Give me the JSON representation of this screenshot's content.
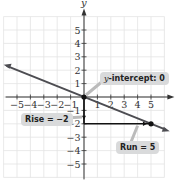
{
  "chart_data": {
    "type": "line",
    "title": "",
    "xlabel": "x",
    "ylabel": "y",
    "xlim": [
      -6,
      6
    ],
    "ylim": [
      -6,
      6
    ],
    "grid": true,
    "x_ticks": [
      -5,
      -4,
      -3,
      -2,
      -1,
      1,
      2,
      3,
      4,
      5
    ],
    "y_ticks": [
      -5,
      -4,
      -3,
      -2,
      -1,
      1,
      2,
      3,
      4,
      5
    ],
    "series": [
      {
        "name": "line",
        "equation": "y = -2/5 x",
        "slope": -0.4,
        "intercept": 0,
        "x": [
          -6,
          6
        ],
        "y": [
          2.4,
          -2.4
        ]
      }
    ],
    "points": [
      {
        "x": 0,
        "y": 0
      },
      {
        "x": 5,
        "y": -2
      }
    ],
    "annotations": [
      {
        "text": "y-intercept: 0",
        "target": [
          0,
          0
        ]
      },
      {
        "text": "Rise = −2",
        "target": [
          0,
          -1.5
        ]
      },
      {
        "text": "Run = 5",
        "target": [
          4,
          -2
        ]
      }
    ],
    "rise_segment": {
      "from": [
        0,
        0
      ],
      "to": [
        0,
        -2
      ]
    },
    "run_segment": {
      "from": [
        0,
        -2
      ],
      "to": [
        5,
        -2
      ]
    }
  },
  "axes": {
    "x_label": "x",
    "y_label": "y"
  },
  "labels": {
    "y_intercept_prefix": "y",
    "y_intercept_rest": "-intercept: 0",
    "rise": "Rise = −2",
    "run": "Run = 5"
  },
  "colors": {
    "line": "#4d4d52",
    "grid": "#e3e3e3",
    "axis": "#333333",
    "label_bg": "#d9dadb"
  }
}
